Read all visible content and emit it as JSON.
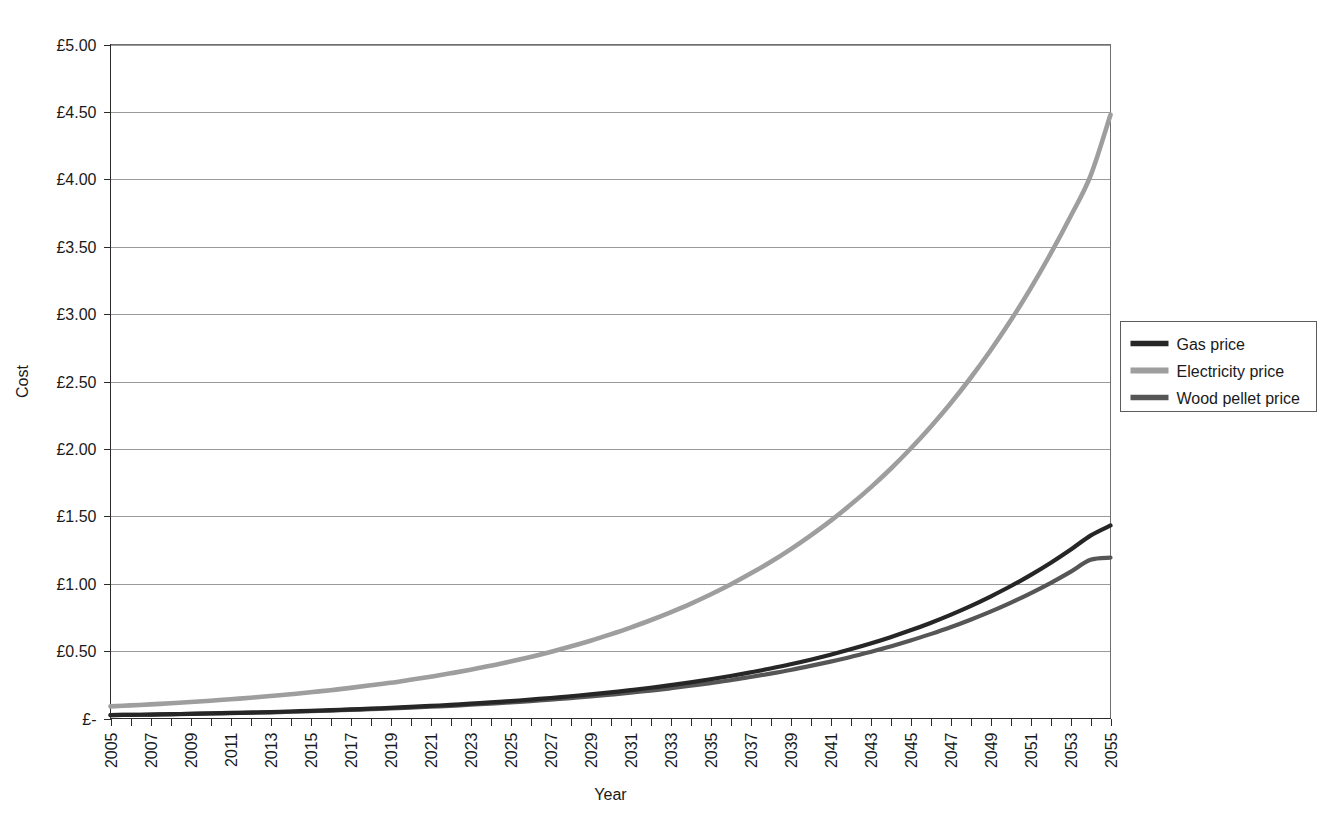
{
  "chart_data": {
    "type": "line",
    "title": "",
    "xlabel": "Year",
    "ylabel": "Cost",
    "grid": true,
    "legend_position": "right",
    "xlim": [
      2005,
      2055
    ],
    "ylim": [
      0,
      5
    ],
    "y_tick_labels": [
      "£5.00",
      "£4.50",
      "£4.00",
      "£3.50",
      "£3.00",
      "£2.50",
      "£2.00",
      "£1.50",
      "£1.00",
      "£0.50",
      "£-"
    ],
    "y_tick_values": [
      5.0,
      4.5,
      4.0,
      3.5,
      3.0,
      2.5,
      2.0,
      1.5,
      1.0,
      0.5,
      0.0
    ],
    "x_tick_labels": [
      "2005",
      "2007",
      "2009",
      "2011",
      "2013",
      "2015",
      "2017",
      "2019",
      "2021",
      "2023",
      "2025",
      "2027",
      "2029",
      "2031",
      "2033",
      "2035",
      "2037",
      "2039",
      "2041",
      "2043",
      "2045",
      "2047",
      "2049",
      "2051",
      "2053",
      "2055"
    ],
    "x": [
      2005,
      2006,
      2007,
      2008,
      2009,
      2010,
      2011,
      2012,
      2013,
      2014,
      2015,
      2016,
      2017,
      2018,
      2019,
      2020,
      2021,
      2022,
      2023,
      2024,
      2025,
      2026,
      2027,
      2028,
      2029,
      2030,
      2031,
      2032,
      2033,
      2034,
      2035,
      2036,
      2037,
      2038,
      2039,
      2040,
      2041,
      2042,
      2043,
      2044,
      2045,
      2046,
      2047,
      2048,
      2049,
      2050,
      2051,
      2052,
      2053,
      2054,
      2055
    ],
    "series": [
      {
        "name": "Gas price",
        "color": "#262626",
        "width": 4.2,
        "values": [
          0.025,
          0.027,
          0.029,
          0.032,
          0.035,
          0.038,
          0.041,
          0.044,
          0.048,
          0.052,
          0.057,
          0.062,
          0.067,
          0.073,
          0.079,
          0.086,
          0.093,
          0.101,
          0.11,
          0.119,
          0.129,
          0.14,
          0.152,
          0.165,
          0.179,
          0.194,
          0.21,
          0.228,
          0.247,
          0.268,
          0.291,
          0.315,
          0.342,
          0.371,
          0.402,
          0.436,
          0.473,
          0.513,
          0.556,
          0.603,
          0.654,
          0.709,
          0.769,
          0.834,
          0.905,
          0.981,
          1.064,
          1.154,
          1.252,
          1.357,
          1.432
        ]
      },
      {
        "name": "Electricity price",
        "color": "#9e9e9e",
        "width": 4.6,
        "values": [
          0.09,
          0.097,
          0.105,
          0.113,
          0.122,
          0.132,
          0.143,
          0.154,
          0.167,
          0.18,
          0.195,
          0.21,
          0.227,
          0.246,
          0.265,
          0.287,
          0.31,
          0.335,
          0.362,
          0.391,
          0.423,
          0.457,
          0.494,
          0.534,
          0.577,
          0.624,
          0.674,
          0.729,
          0.788,
          0.851,
          0.92,
          0.994,
          1.075,
          1.161,
          1.255,
          1.357,
          1.466,
          1.585,
          1.713,
          1.851,
          2.001,
          2.163,
          2.337,
          2.526,
          2.73,
          2.95,
          3.189,
          3.446,
          3.724,
          4.025,
          4.479
        ]
      },
      {
        "name": "Wood pellet price",
        "color": "#565656",
        "width": 4.2,
        "values": [
          0.025,
          0.027,
          0.029,
          0.031,
          0.034,
          0.037,
          0.04,
          0.043,
          0.046,
          0.05,
          0.054,
          0.059,
          0.064,
          0.069,
          0.074,
          0.081,
          0.087,
          0.094,
          0.102,
          0.11,
          0.119,
          0.129,
          0.14,
          0.151,
          0.164,
          0.177,
          0.192,
          0.207,
          0.224,
          0.243,
          0.263,
          0.284,
          0.308,
          0.333,
          0.36,
          0.39,
          0.422,
          0.456,
          0.494,
          0.534,
          0.578,
          0.626,
          0.677,
          0.733,
          0.793,
          0.858,
          0.929,
          1.005,
          1.088,
          1.177,
          1.193
        ]
      }
    ]
  },
  "legend": {
    "items": [
      {
        "label": "Gas price"
      },
      {
        "label": "Electricity price"
      },
      {
        "label": "Wood pellet price"
      }
    ]
  }
}
